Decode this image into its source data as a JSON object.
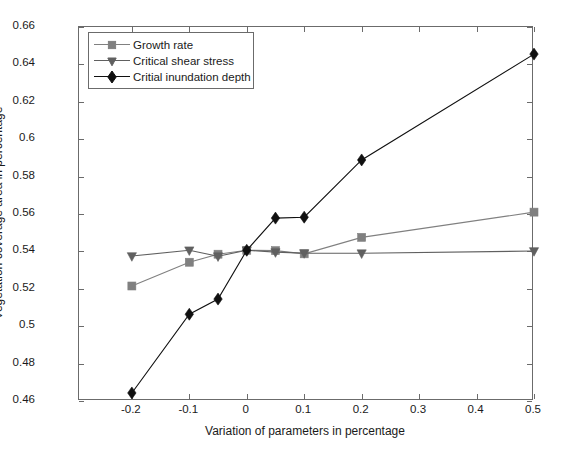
{
  "chart_data": {
    "type": "line",
    "title": "",
    "xlabel": "Variation of parameters in percentage",
    "ylabel": "Vegetation coverage area in percentage",
    "xlim": [
      -0.292,
      0.5
    ],
    "ylim": [
      0.46,
      0.66
    ],
    "xticks": [
      -0.2,
      -0.1,
      0,
      0.1,
      0.2,
      0.3,
      0.4,
      0.5
    ],
    "xticklabels": [
      "-0.2",
      "-0.1",
      "0",
      "0.1",
      "0.2",
      "0.3",
      "0.4",
      "0.5"
    ],
    "yticks": [
      0.46,
      0.48,
      0.5,
      0.52,
      0.54,
      0.56,
      0.58,
      0.6,
      0.62,
      0.64,
      0.66
    ],
    "yticklabels": [
      "0.46",
      "0.48",
      "0.5",
      "0.52",
      "0.54",
      "0.56",
      "0.58",
      "0.6",
      "0.62",
      "0.64",
      "0.66"
    ],
    "grid": false,
    "legend_position": "upper left",
    "series": [
      {
        "name": "Growth rate",
        "marker": "square",
        "color": "#808080",
        "x": [
          -0.2,
          -0.1,
          -0.05,
          0,
          0.05,
          0.1,
          0.2,
          0.5
        ],
        "y": [
          0.5215,
          0.5342,
          0.5385,
          0.5406,
          0.5404,
          0.5387,
          0.5475,
          0.561
        ]
      },
      {
        "name": "Critical shear stress",
        "marker": "triangle-down",
        "color": "#606060",
        "x": [
          -0.2,
          -0.1,
          -0.05,
          0,
          0.05,
          0.1,
          0.2,
          0.5
        ],
        "y": [
          0.5375,
          0.5406,
          0.5374,
          0.5406,
          0.5396,
          0.5391,
          0.539,
          0.5402
        ]
      },
      {
        "name": "Critial inundation depth",
        "marker": "diamond",
        "color": "#101010",
        "x": [
          -0.2,
          -0.1,
          -0.05,
          0,
          0.05,
          0.1,
          0.2,
          0.5
        ],
        "y": [
          0.4643,
          0.5064,
          0.5145,
          0.5406,
          0.5578,
          0.5583,
          0.5889,
          0.6455
        ]
      }
    ]
  },
  "legend": {
    "items": [
      {
        "label": "Growth rate"
      },
      {
        "label": "Critical shear stress"
      },
      {
        "label": "Critial inundation depth"
      }
    ]
  }
}
